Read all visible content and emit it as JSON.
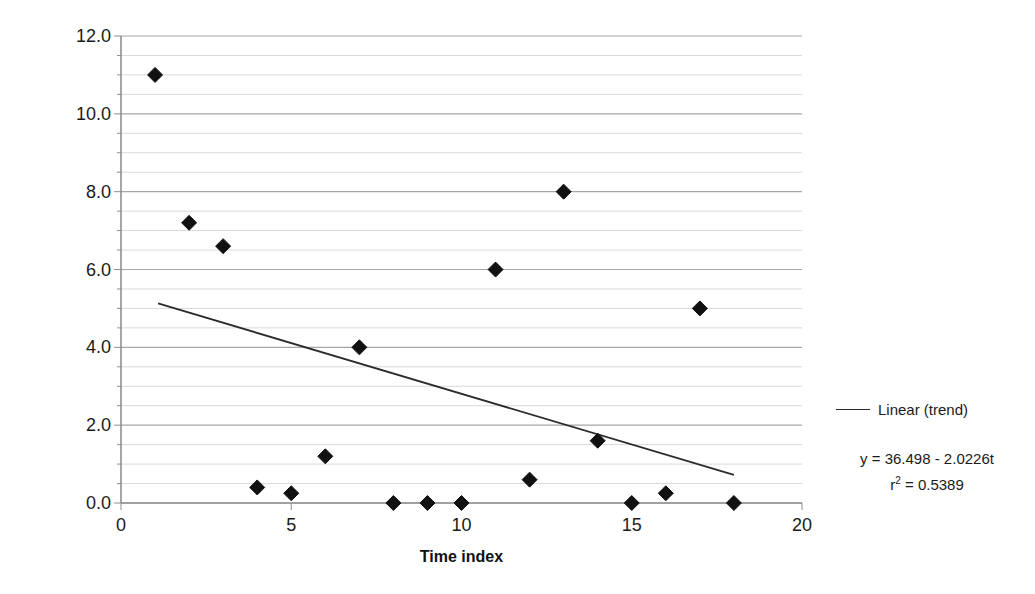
{
  "chart_data": {
    "type": "scatter",
    "title": "",
    "xlabel": "Time index",
    "ylabel": "Winter Rainfall (mm)",
    "xlim": [
      0,
      20
    ],
    "ylim": [
      0,
      12
    ],
    "x_ticks": [
      0,
      5,
      10,
      15,
      20
    ],
    "x_tick_labels": [
      "0",
      "5",
      "10",
      "15",
      "20"
    ],
    "y_ticks": [
      0,
      2,
      4,
      6,
      8,
      10,
      12
    ],
    "y_tick_labels": [
      "0.0",
      "2.0",
      "4.0",
      "6.0",
      "8.0",
      "10.0",
      "12.0"
    ],
    "y_minor_tick_step": 0.5,
    "grid": {
      "horizontal_major": true,
      "horizontal_minor": true,
      "vertical": false,
      "major_color": "#a6a6a6",
      "minor_color": "#d9d9d9"
    },
    "series": [
      {
        "name": "Winter rainfall",
        "type": "scatter",
        "marker": "diamond",
        "color": "#111111",
        "x": [
          1,
          2,
          3,
          4,
          5,
          6,
          7,
          8,
          9,
          10,
          11,
          12,
          13,
          14,
          15,
          16,
          17,
          18
        ],
        "values": [
          11.0,
          7.2,
          6.6,
          0.4,
          0.25,
          1.2,
          4.0,
          0.0,
          0.0,
          0.0,
          6.0,
          0.6,
          8.0,
          1.6,
          0.0,
          0.25,
          5.0,
          0.0
        ]
      },
      {
        "name": "Linear (trend)",
        "type": "line",
        "color": "#2b2b2b",
        "x": [
          1.09,
          18.0
        ],
        "values": [
          5.13,
          0.72
        ]
      }
    ],
    "legend": {
      "position": "right",
      "entries": [
        {
          "label": "Linear (trend)",
          "marker": "line",
          "color": "#2b2b2b"
        }
      ]
    },
    "annotations": [
      {
        "text": "y = 36.498 - 2.0226t"
      },
      {
        "text": "r² = 0.5389",
        "base": "r",
        "sup": "2",
        "rest": " = 0.5389"
      }
    ]
  },
  "layout": {
    "plot_left_px": 121,
    "plot_right_px": 802,
    "plot_top_px": 36,
    "plot_bottom_px": 503
  }
}
